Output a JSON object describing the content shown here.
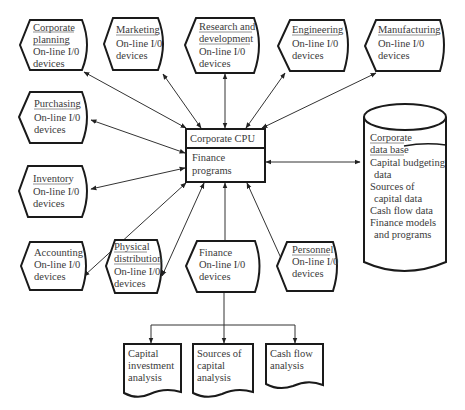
{
  "diagram": {
    "type": "information-system-diagram",
    "cpu": {
      "title": "Corporate CPU",
      "body_lines": [
        "Finance",
        "programs"
      ]
    },
    "terminals": [
      {
        "id": "corporate-planning",
        "lines": [
          "Corporate",
          "planning",
          "On-line I/0",
          "devices"
        ]
      },
      {
        "id": "marketing",
        "lines": [
          "Marketing",
          "On-line I/0",
          "devices"
        ]
      },
      {
        "id": "research-development",
        "lines": [
          "Research and",
          "development",
          "On-line I/0",
          "devices"
        ]
      },
      {
        "id": "engineering",
        "lines": [
          "Engineering",
          "On-line I/0",
          "devices"
        ]
      },
      {
        "id": "manufacturing",
        "lines": [
          "Manufacturing",
          "On-line I/0",
          "devices"
        ]
      },
      {
        "id": "purchasing",
        "lines": [
          "Purchasing",
          "On-line I/0",
          "devices"
        ]
      },
      {
        "id": "inventory",
        "lines": [
          "Inventory",
          "On-line I/0",
          "devices"
        ]
      },
      {
        "id": "accounting",
        "lines": [
          "Accounting",
          "On-line I/0",
          "devices"
        ]
      },
      {
        "id": "physical-distribution",
        "lines": [
          "Physical",
          "distribution",
          "On-line I/0",
          "devices"
        ]
      },
      {
        "id": "finance",
        "lines": [
          "Finance",
          "On-line I/0",
          "devices"
        ]
      },
      {
        "id": "personnel",
        "lines": [
          "Personnel",
          "On-line I/0",
          "devices"
        ]
      }
    ],
    "database": {
      "lines": [
        "Corporate",
        "data base",
        "Capital budgeting",
        "data",
        "Sources of",
        "capital data",
        "Cash flow data",
        "Finance models",
        "and programs"
      ]
    },
    "reports": [
      {
        "id": "capital-investment",
        "lines": [
          "Capital",
          "investment",
          "analysis"
        ]
      },
      {
        "id": "sources-of-capital",
        "lines": [
          "Sources of",
          "capital",
          "analysis"
        ]
      },
      {
        "id": "cash-flow",
        "lines": [
          "Cash flow",
          "analysis"
        ]
      }
    ]
  }
}
